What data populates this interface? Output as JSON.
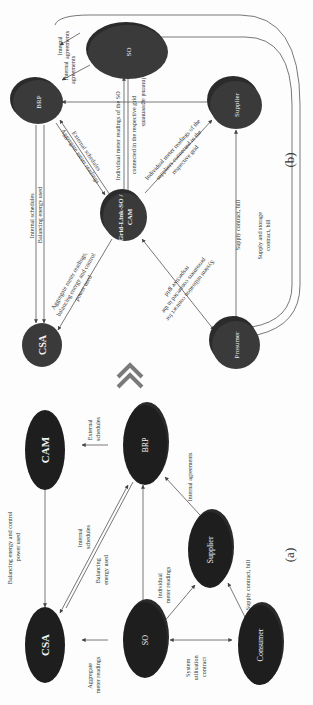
{
  "figure": {
    "panel_a": {
      "caption": "(a)",
      "nodes": {
        "csa": "CSA",
        "cam": "CAM",
        "so": "SO",
        "brp": "BRP",
        "supplier": "Supplier",
        "consumer": "Consumer"
      },
      "edges": {
        "cam_csa": [
          "Balancing energy and control",
          "power used"
        ],
        "brp_cam": [
          "External",
          "schedules"
        ],
        "brp_csa_1": [
          "Internal",
          "schedules"
        ],
        "brp_csa_2": [
          "Balancing",
          "energy used"
        ],
        "so_csa": [
          "Aggregate",
          "meter readings"
        ],
        "so_supplier": [
          "Individual",
          "meter readings"
        ],
        "supplier_brp": [
          "Internal agreements"
        ],
        "consumer_supplier": [
          "Supply contract, bill"
        ],
        "so_consumer": [
          "System",
          "utilisation",
          "contract"
        ]
      }
    },
    "panel_b": {
      "caption": "(b)",
      "nodes": {
        "brp": "BRP",
        "so": "SO",
        "supplier": "Supplier",
        "gridlink": [
          "Grid-Link-SO /",
          "CAM"
        ],
        "csa": "CSA",
        "prosumer": "Prosumer"
      },
      "edges": {
        "brp_so_1": [
          "Internal",
          "agreements"
        ],
        "brp_so_2": [
          "Internal",
          "agreements"
        ],
        "brp_supplier": [
          "Internal agreements"
        ],
        "brp_gridlink_1": [
          "External schedules"
        ],
        "brp_gridlink_2": [
          "Aggregate meter readings"
        ],
        "so_gridlink": [
          "Individual meter readings of the SO",
          "connected in the respective grid"
        ],
        "gridlink_supplier": [
          "Individual meter readings of the",
          "suppliers connected in the",
          "respective grid"
        ],
        "brp_csa_1": [
          "Internal schedules"
        ],
        "brp_csa_2": [
          "Balancing energy used"
        ],
        "gridlink_csa": [
          "Aggregate meter readings,",
          "balancing energy and control",
          "power used"
        ],
        "gridlink_prosumer": [
          "System utilisation contract for",
          "prosumers connected in the",
          "respective grid"
        ],
        "supplier_prosumer": [
          "Supply contract, bill"
        ],
        "loop": [
          "Supply and storage",
          "contract, bill"
        ]
      }
    },
    "transition_icon": "double-chevron-icon",
    "colors": {
      "node_dark_a": "#1e1e1e",
      "node_dark_b": "#3a3a3a",
      "edge": "#555555",
      "chevron": "#7a7a7a"
    }
  }
}
